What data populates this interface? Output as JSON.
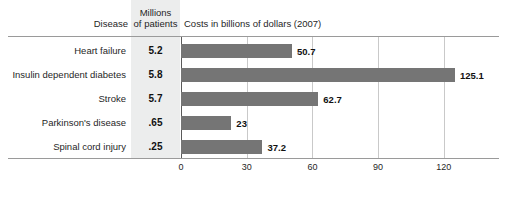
{
  "header": {
    "col_disease": "Disease",
    "col_millions_line1": "Millions",
    "col_millions_line2": "of patients",
    "col_costs": "Costs in billions of dollars (2007)"
  },
  "axis": {
    "ticks": [
      "0",
      "30",
      "60",
      "90",
      "120"
    ]
  },
  "source_credit": "",
  "colors": {
    "bar": "#757575",
    "band": "#eceded",
    "rule": "#9a9a9a",
    "gridline": "#c9c9c9",
    "axis": "#5a5a5a",
    "text": "#1f1f1f"
  },
  "chart_data": {
    "type": "bar",
    "orientation": "horizontal",
    "title": "",
    "xlabel": "Costs in billions of dollars (2007)",
    "ylabel": "Disease",
    "xlim": [
      0,
      135
    ],
    "grid": true,
    "legend": false,
    "xticks": [
      0,
      30,
      60,
      90,
      120
    ],
    "categories": [
      "Heart failure",
      "Insulin dependent diabetes",
      "Stroke",
      "Parkinson's disease",
      "Spinal cord injury"
    ],
    "series": [
      {
        "name": "Costs in billions of dollars (2007)",
        "values": [
          50.7,
          125.1,
          62.7,
          23,
          37.2
        ],
        "labels": [
          "50.7",
          "125.1",
          "62.7",
          "23",
          "37.2"
        ]
      },
      {
        "name": "Millions of patients",
        "values": [
          5.2,
          5.8,
          5.7,
          0.65,
          0.25
        ],
        "labels": [
          "5.2",
          "5.8",
          "5.7",
          ".65",
          ".25"
        ]
      }
    ],
    "rows": [
      {
        "disease": "Heart failure",
        "patients": "5.2",
        "cost": 50.7,
        "cost_label": "50.7"
      },
      {
        "disease": "Insulin dependent diabetes",
        "patients": "5.8",
        "cost": 125.1,
        "cost_label": "125.1"
      },
      {
        "disease": "Stroke",
        "patients": "5.7",
        "cost": 62.7,
        "cost_label": "62.7"
      },
      {
        "disease": "Parkinson's disease",
        "patients": ".65",
        "cost": 23,
        "cost_label": "23"
      },
      {
        "disease": "Spinal cord injury",
        "patients": ".25",
        "cost": 37.2,
        "cost_label": "37.2"
      }
    ]
  }
}
